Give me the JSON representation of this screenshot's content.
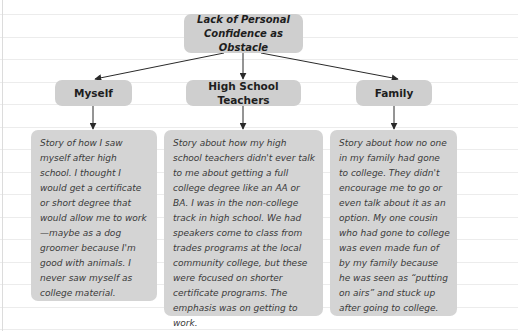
{
  "diagram": {
    "root": {
      "label_line1": "Lack of Personal",
      "label_line2": "Confidence as Obstacle"
    },
    "categories": [
      {
        "label": "Myself"
      },
      {
        "label": "High School Teachers"
      },
      {
        "label": "Family"
      }
    ],
    "descriptions": [
      {
        "text": "Story of how I saw myself after high school. I thought I would get a certificate or short degree that would allow me to work—maybe as a dog groomer because I'm good with animals. I never saw myself as college material."
      },
      {
        "text": "Story about how my high school teachers didn't ever talk to me about getting a full college degree like an AA or BA. I was in the non-college track in high school. We had speakers come to class from trades programs at the local community college, but these were focused on shorter certificate programs. The emphasis was on getting to work."
      },
      {
        "text": "Story about how no one in my family had gone to college. They didn't encourage me to go or even talk about it as an option. My one cousin who had gone to college was even made fun of by my family because he was seen as “putting on airs” and stuck up after going to college."
      }
    ],
    "colors": {
      "node_fill": "#cfcfcf",
      "desc_fill": "#d4d4d4",
      "connector": "#2a2a2a",
      "rule_line": "#ececec"
    }
  }
}
